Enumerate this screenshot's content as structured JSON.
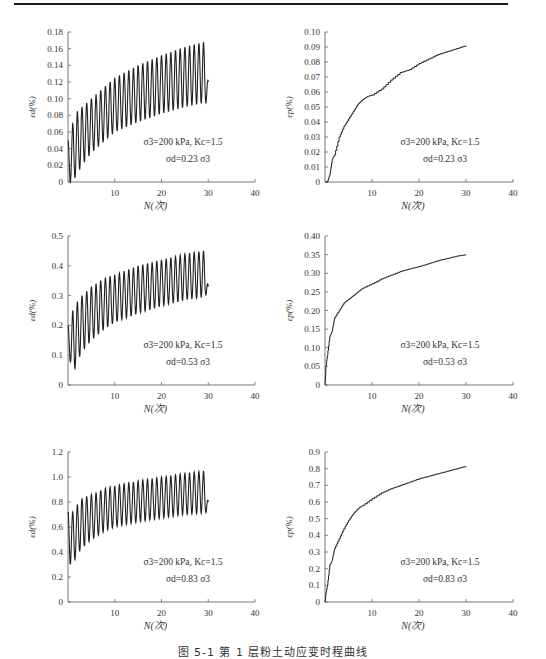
{
  "figure": {
    "caption": "图 5-1 第 1 层粉土动应变时程曲线"
  },
  "chart_data": [
    {
      "id": "row1-left",
      "type": "line",
      "title": "",
      "xlabel": "N(次)",
      "ylabel": "ε_d(%)",
      "xlim": [
        0,
        40
      ],
      "xticks": [
        10,
        20,
        30,
        40
      ],
      "ylim": [
        0,
        0.18
      ],
      "yticks": [
        "0",
        "0.02",
        "0.04",
        "0.06",
        "0.08",
        "0.10",
        "0.12",
        "0.14",
        "0.16",
        "0.18"
      ],
      "grid": false,
      "annotation": [
        "σ3=200 kPa, Kc=1.5",
        "σd=0.23 σ3"
      ],
      "style": "oscillating",
      "cycles": 30,
      "upper_envelope": {
        "x": [
          0.5,
          1,
          2,
          3,
          5,
          8,
          10,
          15,
          20,
          25,
          29,
          30
        ],
        "y": [
          0.05,
          0.07,
          0.085,
          0.09,
          0.1,
          0.115,
          0.125,
          0.14,
          0.152,
          0.162,
          0.168,
          0.12
        ]
      },
      "lower_envelope": {
        "x": [
          0.5,
          1,
          2,
          3,
          5,
          8,
          10,
          15,
          20,
          25,
          29,
          30
        ],
        "y": [
          0.0,
          0.0,
          0.01,
          0.02,
          0.035,
          0.05,
          0.06,
          0.072,
          0.082,
          0.09,
          0.095,
          0.095
        ]
      }
    },
    {
      "id": "row1-right",
      "type": "line",
      "title": "",
      "xlabel": "N(次)",
      "ylabel": "ε_p(%)",
      "xlim": [
        0,
        40
      ],
      "xticks": [
        10,
        20,
        30,
        40
      ],
      "ylim": [
        0,
        0.1
      ],
      "yticks": [
        "0",
        "0.01",
        "0.02",
        "0.03",
        "0.04",
        "0.05",
        "0.06",
        "0.07",
        "0.08",
        "0.09",
        "0.10"
      ],
      "grid": false,
      "annotation": [
        "σ3=200 kPa, Kc=1.5",
        "σd=0.23 σ3"
      ],
      "style": "step",
      "x": [
        0,
        0.5,
        1,
        1.5,
        2,
        3,
        4,
        5,
        6,
        7,
        8,
        9,
        10,
        12,
        14,
        16,
        18,
        20,
        22,
        24,
        26,
        28,
        30
      ],
      "y": [
        0,
        0,
        0.005,
        0.015,
        0.018,
        0.03,
        0.037,
        0.042,
        0.047,
        0.052,
        0.055,
        0.057,
        0.058,
        0.062,
        0.068,
        0.073,
        0.075,
        0.079,
        0.082,
        0.085,
        0.087,
        0.089,
        0.091
      ]
    },
    {
      "id": "row2-left",
      "type": "line",
      "title": "",
      "xlabel": "N(次)",
      "ylabel": "ε_d(%)",
      "xlim": [
        0,
        40
      ],
      "xticks": [
        10,
        20,
        30,
        40
      ],
      "ylim": [
        0,
        0.5
      ],
      "yticks": [
        "0",
        "0.1",
        "0.2",
        "0.3",
        "0.4",
        "0.5"
      ],
      "grid": false,
      "annotation": [
        "σ3=200 kPa, Kc=1.5",
        "σd=0.53 σ3"
      ],
      "style": "oscillating",
      "cycles": 30,
      "upper_envelope": {
        "x": [
          0.5,
          1,
          2,
          3,
          5,
          8,
          10,
          15,
          20,
          25,
          29,
          30
        ],
        "y": [
          0.2,
          0.25,
          0.28,
          0.3,
          0.33,
          0.36,
          0.37,
          0.4,
          0.42,
          0.44,
          0.45,
          0.33
        ]
      },
      "lower_envelope": {
        "x": [
          0.5,
          1,
          2,
          3,
          5,
          8,
          10,
          15,
          20,
          25,
          29,
          30
        ],
        "y": [
          0.08,
          0.03,
          0.08,
          0.11,
          0.15,
          0.19,
          0.21,
          0.24,
          0.265,
          0.285,
          0.295,
          0.31
        ]
      }
    },
    {
      "id": "row2-right",
      "type": "line",
      "title": "",
      "xlabel": "N(次)",
      "ylabel": "ε_p(%)",
      "xlim": [
        0,
        40
      ],
      "xticks": [
        10,
        20,
        30,
        40
      ],
      "ylim": [
        0,
        0.4
      ],
      "yticks": [
        "0",
        "0.05",
        "0.10",
        "0.15",
        "0.20",
        "0.25",
        "0.30",
        "0.35",
        "0.40"
      ],
      "grid": false,
      "annotation": [
        "σ3=200 kPa, Kc=1.5",
        "σd=0.53 σ3"
      ],
      "style": "step",
      "x": [
        0,
        0.2,
        0.5,
        1,
        1.5,
        2,
        3,
        4,
        5,
        6,
        7,
        8,
        10,
        12,
        14,
        16,
        18,
        20,
        22,
        24,
        26,
        28,
        30
      ],
      "y": [
        0,
        0.05,
        0.08,
        0.13,
        0.145,
        0.18,
        0.2,
        0.22,
        0.23,
        0.24,
        0.25,
        0.26,
        0.272,
        0.285,
        0.295,
        0.305,
        0.312,
        0.318,
        0.326,
        0.334,
        0.34,
        0.346,
        0.35
      ]
    },
    {
      "id": "row3-left",
      "type": "line",
      "title": "",
      "xlabel": "N(次)",
      "ylabel": "ε_d(%)",
      "xlim": [
        0,
        40
      ],
      "xticks": [
        10,
        20,
        30,
        40
      ],
      "ylim": [
        0,
        1.2
      ],
      "yticks": [
        "0",
        "0.2",
        "0.4",
        "0.6",
        "0.8",
        "1.0",
        "1.2"
      ],
      "grid": false,
      "annotation": [
        "σ3=200 kPa, Kc=1.5",
        "σd=0.83 σ3"
      ],
      "style": "oscillating",
      "cycles": 30,
      "upper_envelope": {
        "x": [
          0.5,
          1,
          2,
          3,
          5,
          8,
          10,
          15,
          20,
          25,
          29,
          30
        ],
        "y": [
          0.72,
          0.72,
          0.78,
          0.83,
          0.86,
          0.91,
          0.93,
          0.97,
          1.0,
          1.03,
          1.05,
          0.8
        ]
      },
      "lower_envelope": {
        "x": [
          0.5,
          1,
          2,
          3,
          5,
          8,
          10,
          15,
          20,
          25,
          29,
          30
        ],
        "y": [
          0.3,
          0.3,
          0.38,
          0.43,
          0.5,
          0.57,
          0.6,
          0.64,
          0.67,
          0.7,
          0.71,
          0.72
        ]
      }
    },
    {
      "id": "row3-right",
      "type": "line",
      "title": "",
      "xlabel": "N(次)",
      "ylabel": "ε_p(%)",
      "xlim": [
        0,
        40
      ],
      "xticks": [
        10,
        20,
        30,
        40
      ],
      "ylim": [
        0,
        0.9
      ],
      "yticks": [
        "0",
        "0.1",
        "0.2",
        "0.3",
        "0.4",
        "0.5",
        "0.6",
        "0.7",
        "0.8",
        "0.9"
      ],
      "grid": false,
      "annotation": [
        "σ3=200 kPa, Kc=1.5",
        "σd=0.83 σ3"
      ],
      "style": "step",
      "x": [
        0,
        0.2,
        0.5,
        1,
        1.5,
        2,
        3,
        4,
        5,
        6,
        7,
        8,
        10,
        12,
        14,
        16,
        18,
        20,
        22,
        24,
        26,
        28,
        30
      ],
      "y": [
        0,
        0.05,
        0.1,
        0.22,
        0.25,
        0.32,
        0.38,
        0.44,
        0.49,
        0.53,
        0.56,
        0.58,
        0.62,
        0.655,
        0.68,
        0.7,
        0.72,
        0.74,
        0.755,
        0.77,
        0.785,
        0.8,
        0.815
      ]
    }
  ],
  "layout_hint": {
    "panels": [
      {
        "id": "row1-left",
        "x0": 68,
        "x40": 255,
        "ytop": 32,
        "ybot": 182
      },
      {
        "id": "row1-right",
        "x0": 325,
        "x40": 513,
        "ytop": 32,
        "ybot": 182
      },
      {
        "id": "row2-left",
        "x0": 68,
        "x40": 255,
        "ytop": 236,
        "ybot": 385
      },
      {
        "id": "row2-right",
        "x0": 325,
        "x40": 513,
        "ytop": 236,
        "ybot": 385
      },
      {
        "id": "row3-left",
        "x0": 68,
        "x40": 255,
        "ytop": 452,
        "ybot": 602
      },
      {
        "id": "row3-right",
        "x0": 325,
        "x40": 513,
        "ytop": 452,
        "ybot": 602
      }
    ]
  }
}
